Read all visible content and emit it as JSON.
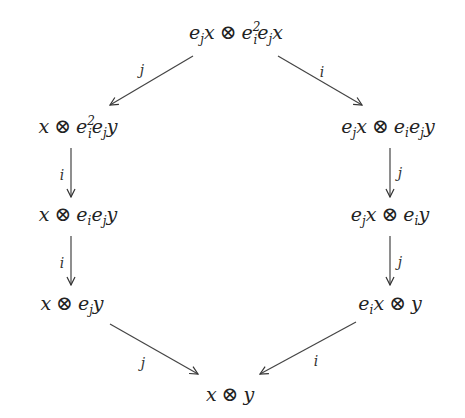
{
  "diagram": {
    "type": "commutative-diagram",
    "nodes": [
      {
        "id": "top",
        "parts": [
          "e",
          "j",
          "x",
          "⊗",
          "e",
          "i",
          "2",
          "e",
          "j",
          "x"
        ],
        "latex": "e_j x \\otimes e_i^2 e_j x"
      },
      {
        "id": "l1",
        "latex": "x \\otimes e_i^2 e_j y"
      },
      {
        "id": "l2",
        "latex": "x \\otimes e_i e_j y"
      },
      {
        "id": "l3",
        "latex": "x \\otimes e_j y"
      },
      {
        "id": "r1",
        "latex": "e_j x \\otimes e_i e_j y"
      },
      {
        "id": "r2",
        "latex": "e_j x \\otimes e_i y"
      },
      {
        "id": "r3",
        "latex": "e_i x \\otimes y"
      },
      {
        "id": "bottom",
        "latex": "x \\otimes y"
      }
    ],
    "edges": [
      {
        "from": "top",
        "to": "l1",
        "label": "j"
      },
      {
        "from": "top",
        "to": "r1",
        "label": "i"
      },
      {
        "from": "l1",
        "to": "l2",
        "label": "i"
      },
      {
        "from": "l2",
        "to": "l3",
        "label": "i"
      },
      {
        "from": "r1",
        "to": "r2",
        "label": "j"
      },
      {
        "from": "r2",
        "to": "r3",
        "label": "j"
      },
      {
        "from": "l3",
        "to": "bottom",
        "label": "j"
      },
      {
        "from": "r3",
        "to": "bottom",
        "label": "i"
      }
    ],
    "symbols": {
      "e": "e",
      "x": "x",
      "y": "y",
      "i": "i",
      "j": "j",
      "two": "2",
      "otimes": "⊗"
    }
  }
}
